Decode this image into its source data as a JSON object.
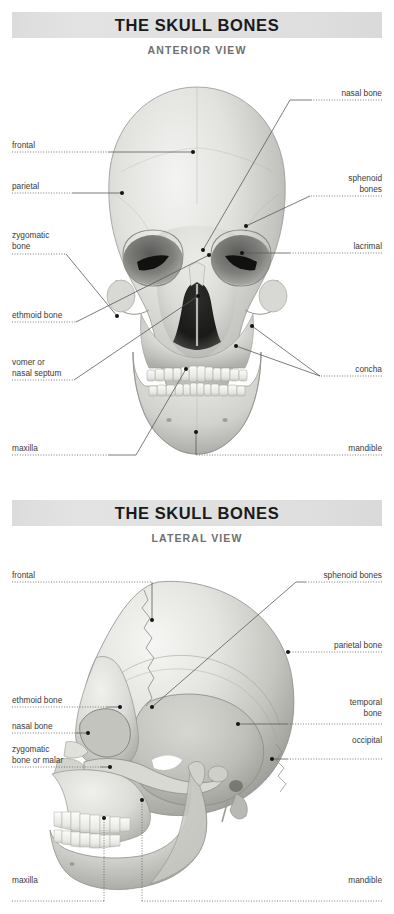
{
  "document": {
    "background_color": "#ffffff",
    "text_color": "#3a3a3a",
    "title_bar_color": "#dfdfdf",
    "title_text_color": "#1a1a1a",
    "subtitle_text_color": "#6f6f6f",
    "leader_line_color": "#555555"
  },
  "figures": [
    {
      "id": "anterior",
      "title": "THE SKULL BONES",
      "subtitle": "ANTERIOR VIEW",
      "labels_left": [
        {
          "id": "frontal",
          "text": "frontal"
        },
        {
          "id": "parietal",
          "text": "parietal"
        },
        {
          "id": "zygomatic-bone",
          "text": "zygomatic\nbone"
        },
        {
          "id": "ethmoid-bone",
          "text": "ethmoid bone"
        },
        {
          "id": "vomer",
          "text": "vomer or\nnasal septum"
        },
        {
          "id": "maxilla",
          "text": "maxilla"
        }
      ],
      "labels_right": [
        {
          "id": "nasal-bone",
          "text": "nasal bone"
        },
        {
          "id": "sphenoid-bones",
          "text": "sphenoid\nbones"
        },
        {
          "id": "lacrimal",
          "text": "lacrimal"
        },
        {
          "id": "concha",
          "text": "concha"
        },
        {
          "id": "mandible",
          "text": "mandible"
        }
      ]
    },
    {
      "id": "lateral",
      "title": "THE SKULL BONES",
      "subtitle": "LATERAL VIEW",
      "labels_left": [
        {
          "id": "frontal",
          "text": "frontal"
        },
        {
          "id": "ethmoid-bone",
          "text": "ethmoid bone"
        },
        {
          "id": "nasal-bone",
          "text": "nasal bone"
        },
        {
          "id": "zygomatic-malar",
          "text": "zygomatic\nbone or malar"
        },
        {
          "id": "maxilla",
          "text": "maxilla"
        }
      ],
      "labels_right": [
        {
          "id": "sphenoid-bones",
          "text": "sphenoid bones"
        },
        {
          "id": "parietal-bone",
          "text": "parietal bone"
        },
        {
          "id": "temporal-bone",
          "text": "temporal\nbone"
        },
        {
          "id": "occipital",
          "text": "occipital"
        },
        {
          "id": "mandible",
          "text": "mandible"
        }
      ]
    }
  ]
}
